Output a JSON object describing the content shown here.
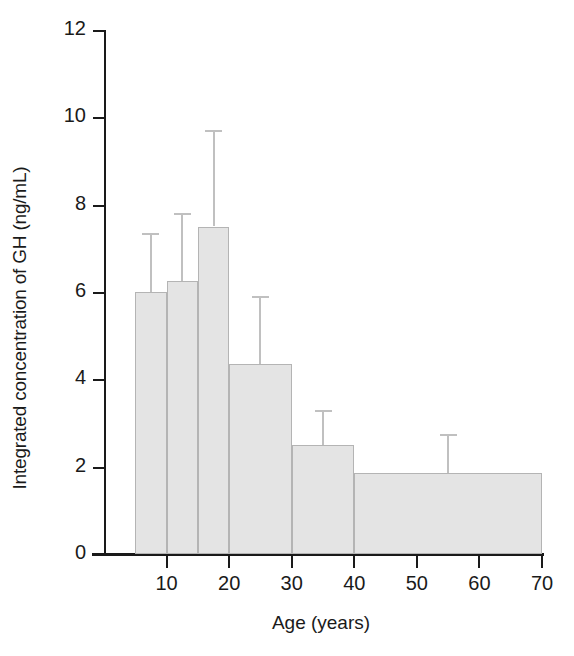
{
  "chart_data": {
    "type": "bar",
    "title": "",
    "xlabel": "Age (years)",
    "ylabel": "Integrated concentration of GH (ng/mL)",
    "xlim": [
      0,
      70
    ],
    "ylim": [
      0,
      12
    ],
    "grid": false,
    "legend": null,
    "xticks": [
      10,
      20,
      30,
      40,
      50,
      60,
      70
    ],
    "xtick_labels": [
      "10",
      "20",
      "30",
      "40",
      "50",
      "60",
      "70"
    ],
    "yticks": [
      0,
      2,
      4,
      6,
      8,
      10,
      12
    ],
    "ytick_labels": [
      "0",
      "2",
      "4",
      "6",
      "8",
      "10",
      "12"
    ],
    "categories": [
      "5-10",
      "10-15",
      "15-20",
      "20-30",
      "30-40",
      "40-70"
    ],
    "bins": [
      {
        "label": "5-10",
        "x_start": 5,
        "x_end": 10,
        "value": 6.0,
        "error_upper": 7.35
      },
      {
        "label": "10-15",
        "x_start": 10,
        "x_end": 15,
        "value": 6.25,
        "error_upper": 7.8
      },
      {
        "label": "15-20",
        "x_start": 15,
        "x_end": 20,
        "value": 7.5,
        "error_upper": 9.7
      },
      {
        "label": "20-30",
        "x_start": 20,
        "x_end": 30,
        "value": 4.35,
        "error_upper": 5.9
      },
      {
        "label": "30-40",
        "x_start": 30,
        "x_end": 40,
        "value": 2.5,
        "error_upper": 3.3
      },
      {
        "label": "40-70",
        "x_start": 40,
        "x_end": 70,
        "value": 1.85,
        "error_upper": 2.75
      }
    ],
    "values": [
      6.0,
      6.25,
      7.5,
      4.35,
      2.5,
      1.85
    ],
    "errors_upper": [
      7.35,
      7.8,
      9.7,
      5.9,
      3.3,
      2.75
    ],
    "colors": {
      "bar_fill": "#e4e4e4",
      "bar_stroke": "#b4b4b4",
      "error_bar": "#c0c0c0",
      "axis": "#1a1a1a",
      "background": "#ffffff"
    }
  }
}
